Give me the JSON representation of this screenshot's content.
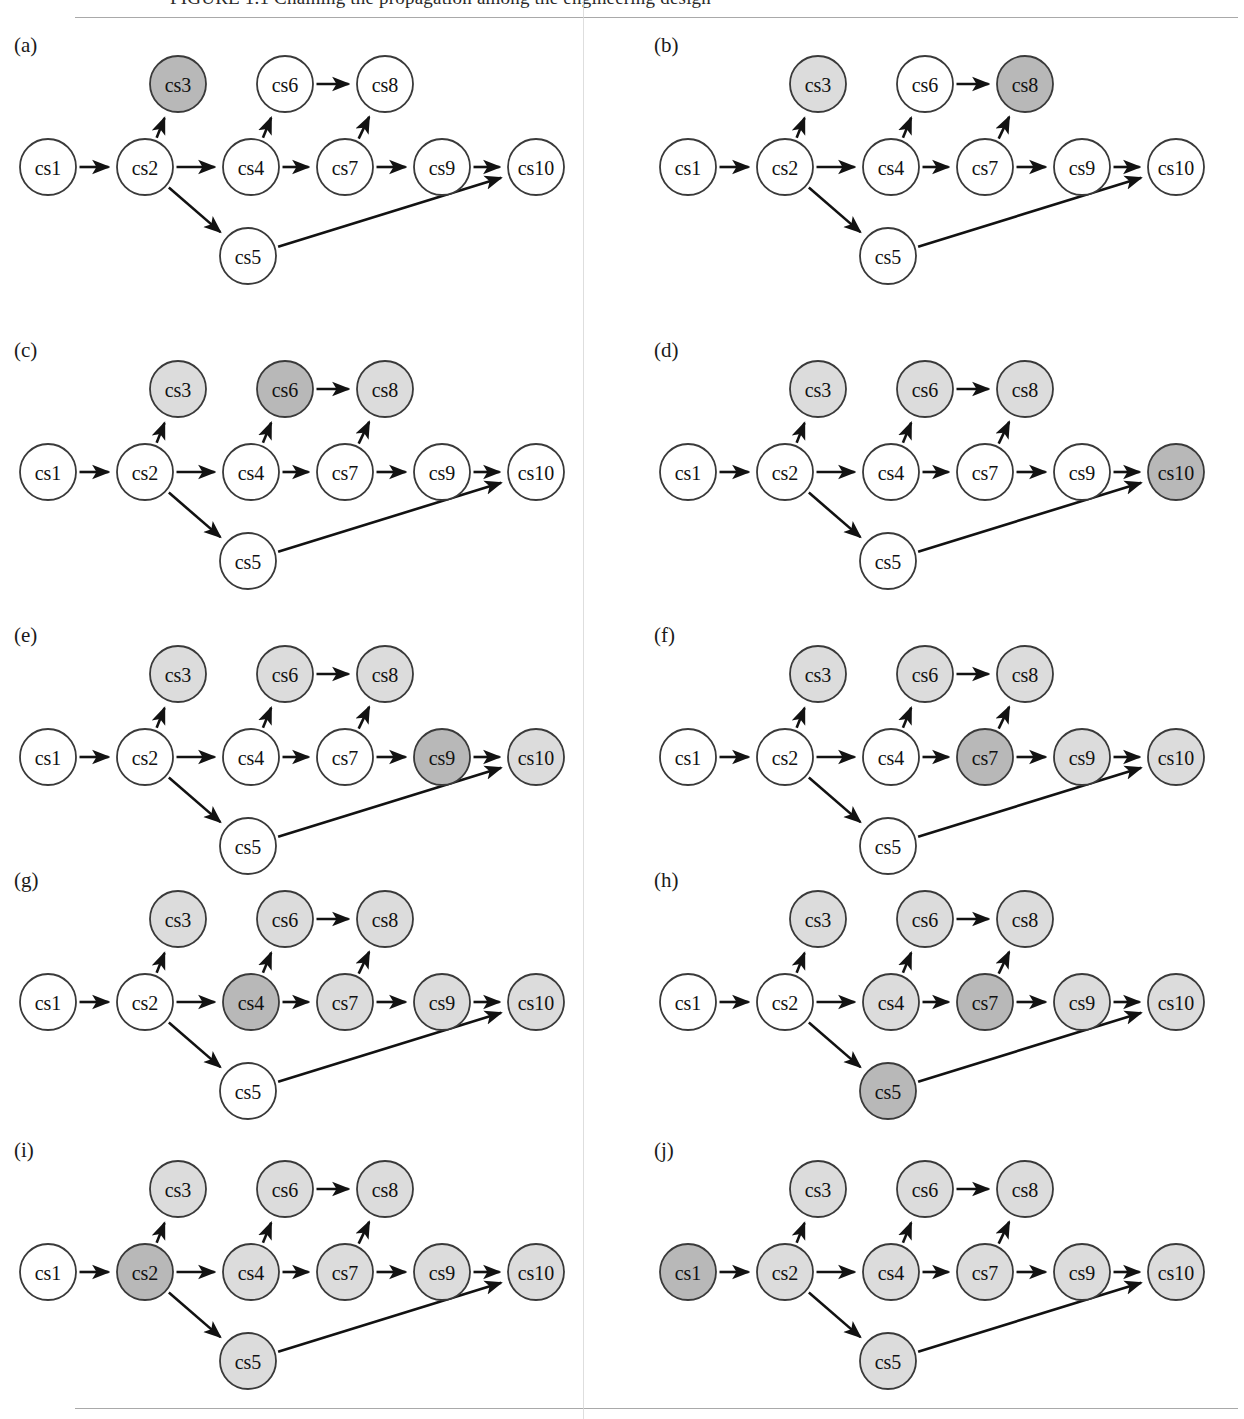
{
  "figure": {
    "caption_partial": "FIGURE 1.1   Chaining the propagation among the engineering design",
    "top_rule": true,
    "bottom_rule": true,
    "fold_line": true
  },
  "colors": {
    "node_stroke": "#3a3a3a",
    "node_fill_plain": "#ffffff",
    "node_fill_light": "#dcdcdc",
    "node_fill_dark": "#b8b8b8",
    "edge": "#121212",
    "rule": "#9a9a9a",
    "text": "#111111"
  },
  "graph": {
    "nodes": [
      {
        "id": "cs1",
        "label": "cs1",
        "x": 48,
        "y": 142
      },
      {
        "id": "cs2",
        "label": "cs2",
        "x": 145,
        "y": 142
      },
      {
        "id": "cs3",
        "label": "cs3",
        "x": 178,
        "y": 59
      },
      {
        "id": "cs4",
        "label": "cs4",
        "x": 251,
        "y": 142
      },
      {
        "id": "cs5",
        "label": "cs5",
        "x": 248,
        "y": 231
      },
      {
        "id": "cs6",
        "label": "cs6",
        "x": 285,
        "y": 59
      },
      {
        "id": "cs7",
        "label": "cs7",
        "x": 345,
        "y": 142
      },
      {
        "id": "cs8",
        "label": "cs8",
        "x": 385,
        "y": 59
      },
      {
        "id": "cs9",
        "label": "cs9",
        "x": 442,
        "y": 142
      },
      {
        "id": "cs10",
        "label": "cs10",
        "x": 536,
        "y": 142
      }
    ],
    "node_radius": 28,
    "edges": [
      {
        "from": "cs1",
        "to": "cs2"
      },
      {
        "from": "cs2",
        "to": "cs3"
      },
      {
        "from": "cs2",
        "to": "cs4"
      },
      {
        "from": "cs2",
        "to": "cs5"
      },
      {
        "from": "cs4",
        "to": "cs6"
      },
      {
        "from": "cs4",
        "to": "cs7"
      },
      {
        "from": "cs6",
        "to": "cs8"
      },
      {
        "from": "cs7",
        "to": "cs8"
      },
      {
        "from": "cs7",
        "to": "cs9"
      },
      {
        "from": "cs9",
        "to": "cs10"
      },
      {
        "from": "cs5",
        "to": "cs10"
      }
    ]
  },
  "panels": [
    {
      "key": "a",
      "label": "(a)",
      "col": 0,
      "row": 0,
      "shading": {
        "cs1": "plain",
        "cs2": "plain",
        "cs3": "dark",
        "cs4": "plain",
        "cs5": "plain",
        "cs6": "plain",
        "cs7": "plain",
        "cs8": "plain",
        "cs9": "plain",
        "cs10": "plain"
      }
    },
    {
      "key": "b",
      "label": "(b)",
      "col": 1,
      "row": 0,
      "shading": {
        "cs1": "plain",
        "cs2": "plain",
        "cs3": "light",
        "cs4": "plain",
        "cs5": "plain",
        "cs6": "plain",
        "cs7": "plain",
        "cs8": "dark",
        "cs9": "plain",
        "cs10": "plain"
      }
    },
    {
      "key": "c",
      "label": "(c)",
      "col": 0,
      "row": 1,
      "shading": {
        "cs1": "plain",
        "cs2": "plain",
        "cs3": "light",
        "cs4": "plain",
        "cs5": "plain",
        "cs6": "dark",
        "cs7": "plain",
        "cs8": "light",
        "cs9": "plain",
        "cs10": "plain"
      }
    },
    {
      "key": "d",
      "label": "(d)",
      "col": 1,
      "row": 1,
      "shading": {
        "cs1": "plain",
        "cs2": "plain",
        "cs3": "light",
        "cs4": "plain",
        "cs5": "plain",
        "cs6": "light",
        "cs7": "plain",
        "cs8": "light",
        "cs9": "plain",
        "cs10": "dark"
      }
    },
    {
      "key": "e",
      "label": "(e)",
      "col": 0,
      "row": 2,
      "shading": {
        "cs1": "plain",
        "cs2": "plain",
        "cs3": "light",
        "cs4": "plain",
        "cs5": "plain",
        "cs6": "light",
        "cs7": "plain",
        "cs8": "light",
        "cs9": "dark",
        "cs10": "light"
      }
    },
    {
      "key": "f",
      "label": "(f)",
      "col": 1,
      "row": 2,
      "shading": {
        "cs1": "plain",
        "cs2": "plain",
        "cs3": "light",
        "cs4": "plain",
        "cs5": "plain",
        "cs6": "light",
        "cs7": "dark",
        "cs8": "light",
        "cs9": "light",
        "cs10": "light"
      }
    },
    {
      "key": "g",
      "label": "(g)",
      "col": 0,
      "row": 3,
      "shading": {
        "cs1": "plain",
        "cs2": "plain",
        "cs3": "light",
        "cs4": "dark",
        "cs5": "plain",
        "cs6": "light",
        "cs7": "light",
        "cs8": "light",
        "cs9": "light",
        "cs10": "light"
      }
    },
    {
      "key": "h",
      "label": "(h)",
      "col": 1,
      "row": 3,
      "shading": {
        "cs1": "plain",
        "cs2": "plain",
        "cs3": "light",
        "cs4": "light",
        "cs5": "dark",
        "cs6": "light",
        "cs7": "dark",
        "cs8": "light",
        "cs9": "light",
        "cs10": "light"
      }
    },
    {
      "key": "i",
      "label": "(i)",
      "col": 0,
      "row": 4,
      "shading": {
        "cs1": "plain",
        "cs2": "dark",
        "cs3": "light",
        "cs4": "light",
        "cs5": "light",
        "cs6": "light",
        "cs7": "light",
        "cs8": "light",
        "cs9": "light",
        "cs10": "light"
      }
    },
    {
      "key": "j",
      "label": "(j)",
      "col": 1,
      "row": 4,
      "shading": {
        "cs1": "dark",
        "cs2": "light",
        "cs3": "light",
        "cs4": "light",
        "cs5": "light",
        "cs6": "light",
        "cs7": "light",
        "cs8": "light",
        "cs9": "light",
        "cs10": "light"
      }
    }
  ],
  "layout": {
    "col_x": [
      0,
      640
    ],
    "row_y": [
      25,
      330,
      615,
      860,
      1130
    ]
  }
}
